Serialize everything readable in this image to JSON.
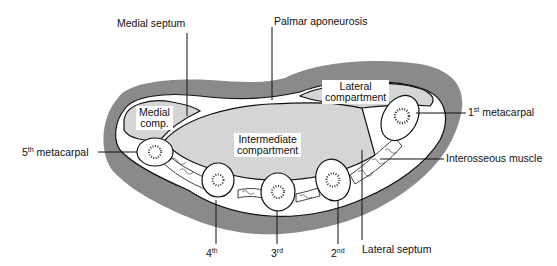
{
  "labels": {
    "medial_septum": "Medial septum",
    "palmar_aponeurosis": "Palmar aponeurosis",
    "first_metacarpal_num": "1",
    "first_metacarpal_sup": "st",
    "first_metacarpal_text": " metacarpal",
    "fifth_metacarpal_num": "5",
    "fifth_metacarpal_sup": "th",
    "fifth_metacarpal_text": " metacarpal",
    "interosseous_muscle": "Interosseous muscle",
    "fourth_num": "4",
    "fourth_sup": "th",
    "third_num": "3",
    "third_sup": "rd",
    "second_num": "2",
    "second_sup": "nd",
    "lateral_septum": "Lateral septum"
  },
  "compartments": {
    "medial_line1": "Medial",
    "medial_line2": "comp.",
    "lateral_line1": "Lateral",
    "lateral_line2": "compartment",
    "intermediate_line1": "Intermediate",
    "intermediate_line2": "compartment"
  },
  "colors": {
    "outer_tissue": "#8a8a8a",
    "compartment_fill": "#d6d6d6",
    "fascia": "#ffffff",
    "outline": "#111111"
  }
}
